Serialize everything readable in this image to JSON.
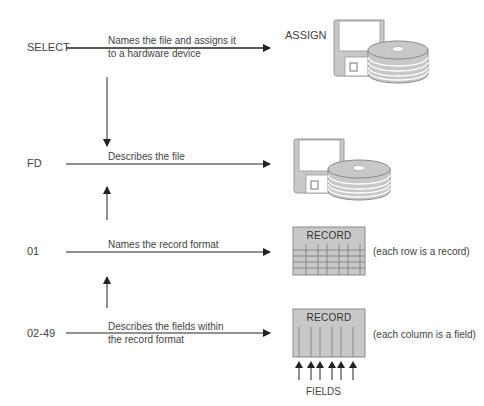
{
  "diagram": {
    "rows": [
      {
        "keyword": "SELECT",
        "description_lines": [
          "Names the file and assigns it",
          "to a hardware device"
        ],
        "target_label": "ASSIGN",
        "target_icon": "floppy-disk-and-disk-pack-icon"
      },
      {
        "keyword": "FD",
        "description_lines": [
          "Describes the file"
        ],
        "target_icon": "floppy-disk-and-disk-pack-icon"
      },
      {
        "keyword": "01",
        "description_lines": [
          "Names the record format"
        ],
        "target_icon": "record-grid-icon",
        "target_title": "RECORD",
        "note": "(each row is a record)"
      },
      {
        "keyword": "02-49",
        "description_lines": [
          "Describes the fields within",
          "the record format"
        ],
        "target_icon": "record-columns-icon",
        "target_title": "RECORD",
        "note": "(each column is a field)",
        "sub_label": "FIELDS"
      }
    ],
    "colors": {
      "line": "#222222",
      "icon_fill": "#c8c8c8",
      "icon_stroke": "#8a8a8a",
      "text": "#444444"
    }
  }
}
